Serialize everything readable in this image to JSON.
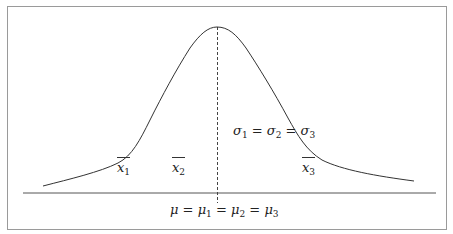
{
  "diagram": {
    "type": "normal-distribution-illustration",
    "colors": {
      "frame": "#9a9a9a",
      "curve": "#333333",
      "axis": "#555555",
      "text": "#222222"
    },
    "mean_label": {
      "lhs": "μ",
      "terms": [
        "μ",
        "μ",
        "μ"
      ],
      "subscripts": [
        "1",
        "2",
        "3"
      ],
      "text": "μ = μ1 = μ2 = μ3"
    },
    "sigma_label": {
      "symbol": "σ",
      "subscripts": [
        "1",
        "2",
        "3"
      ],
      "text": "σ1 = σ2 = σ3"
    },
    "sample_means": [
      {
        "symbol": "x",
        "subscript": "1",
        "text": "x̄1"
      },
      {
        "symbol": "x",
        "subscript": "2",
        "text": "x̄2"
      },
      {
        "symbol": "x",
        "subscript": "3",
        "text": "x̄3"
      }
    ],
    "equals": "="
  }
}
